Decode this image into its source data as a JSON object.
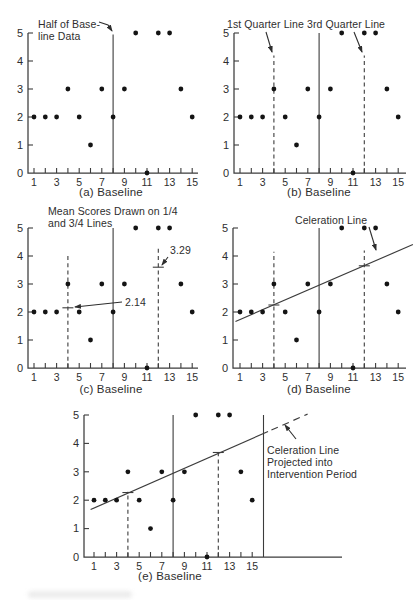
{
  "figure": {
    "ink": "#2e2e2e",
    "axis_color": "#3c3c3c",
    "dot_color": "#141414",
    "background": "#ffffff"
  },
  "chart_data": [
    {
      "id": "a",
      "type": "scatter",
      "caption": "(a) Baseline",
      "xlim": [
        0,
        16
      ],
      "ylim": [
        0,
        5
      ],
      "x_ticks_every": [
        1,
        2,
        3,
        4,
        5,
        6,
        7,
        8,
        9,
        10,
        11,
        12,
        13,
        14,
        15
      ],
      "x_labeled": [
        1,
        3,
        5,
        7,
        9,
        11,
        13,
        15
      ],
      "y_ticks": [
        0,
        1,
        2,
        3,
        4,
        5
      ],
      "points": [
        [
          1,
          2
        ],
        [
          2,
          2
        ],
        [
          3,
          2
        ],
        [
          4,
          3
        ],
        [
          5,
          2
        ],
        [
          6,
          1
        ],
        [
          7,
          3
        ],
        [
          8,
          2
        ],
        [
          9,
          3
        ],
        [
          10,
          5
        ],
        [
          11,
          0
        ],
        [
          12,
          5
        ],
        [
          13,
          5
        ],
        [
          14,
          3
        ],
        [
          15,
          2
        ]
      ],
      "vlines": [
        {
          "x": 8,
          "from": 0,
          "to": 4.95,
          "style": "solid"
        }
      ],
      "mean_marks": [],
      "celeration_segments": [],
      "annotations": [
        {
          "lines": [
            "Half of Base-",
            "line Data"
          ],
          "x": 38,
          "y": 28,
          "lh": 12,
          "arrow": [
            [
              99,
              22
            ],
            [
              108,
              25
            ],
            [
              112,
              31
            ]
          ]
        }
      ]
    },
    {
      "id": "b",
      "type": "scatter",
      "caption": "(b) Baseline",
      "xlim": [
        0,
        16
      ],
      "ylim": [
        0,
        5
      ],
      "x_ticks_every": [
        1,
        2,
        3,
        4,
        5,
        6,
        7,
        8,
        9,
        10,
        11,
        12,
        13,
        14,
        15
      ],
      "x_labeled": [
        1,
        3,
        5,
        7,
        9,
        11,
        13,
        15
      ],
      "y_ticks": [
        0,
        1,
        2,
        3,
        4,
        5
      ],
      "points": [
        [
          1,
          2
        ],
        [
          2,
          2
        ],
        [
          3,
          2
        ],
        [
          4,
          3
        ],
        [
          5,
          2
        ],
        [
          6,
          1
        ],
        [
          7,
          3
        ],
        [
          8,
          2
        ],
        [
          9,
          3
        ],
        [
          10,
          5
        ],
        [
          11,
          0
        ],
        [
          12,
          5
        ],
        [
          13,
          5
        ],
        [
          14,
          3
        ],
        [
          15,
          2
        ]
      ],
      "vlines": [
        {
          "x": 8,
          "from": 0,
          "to": 5,
          "style": "solid"
        },
        {
          "x": 4,
          "from": 0,
          "to": 4.2,
          "style": "dashed"
        },
        {
          "x": 12,
          "from": 0,
          "to": 4.2,
          "style": "dashed"
        }
      ],
      "mean_marks": [],
      "celeration_segments": [],
      "annotations": [
        {
          "lines": [
            "1st Quarter Line"
          ],
          "x": 19,
          "y": 28,
          "lh": 12,
          "arrow": [
            [
              58,
              32
            ],
            [
              64,
              52
            ]
          ]
        },
        {
          "lines": [
            "3rd Quarter Line"
          ],
          "x": 99,
          "y": 28,
          "lh": 12,
          "arrow": [
            [
              146,
              32
            ],
            [
              154,
              52
            ]
          ]
        }
      ]
    },
    {
      "id": "c",
      "type": "scatter",
      "caption": "(c) Baseline",
      "xlim": [
        0,
        16
      ],
      "ylim": [
        0,
        5
      ],
      "x_ticks_every": [
        1,
        2,
        3,
        4,
        5,
        6,
        7,
        8,
        9,
        10,
        11,
        12,
        13,
        14,
        15
      ],
      "x_labeled": [
        1,
        3,
        5,
        7,
        9,
        11,
        13,
        15
      ],
      "y_ticks": [
        0,
        1,
        2,
        3,
        4,
        5
      ],
      "points": [
        [
          1,
          2
        ],
        [
          2,
          2
        ],
        [
          3,
          2
        ],
        [
          4,
          3
        ],
        [
          5,
          2
        ],
        [
          6,
          1
        ],
        [
          7,
          3
        ],
        [
          8,
          2
        ],
        [
          9,
          3
        ],
        [
          10,
          5
        ],
        [
          11,
          0
        ],
        [
          12,
          5
        ],
        [
          13,
          5
        ],
        [
          14,
          3
        ],
        [
          15,
          2
        ]
      ],
      "vlines": [
        {
          "x": 8,
          "from": 0,
          "to": 5,
          "style": "solid"
        },
        {
          "x": 4,
          "from": 0,
          "to": 4.05,
          "style": "dashed"
        },
        {
          "x": 12,
          "from": 0,
          "to": 4.35,
          "style": "dashed"
        }
      ],
      "mean_marks": [
        {
          "x": 4,
          "y_draw": 2.15,
          "value": 2.14
        },
        {
          "x": 12,
          "y_draw": 3.6,
          "value": 3.29
        }
      ],
      "celeration_segments": [],
      "annotations": [
        {
          "lines": [
            "Mean Scores Drawn on 1/4",
            "and 3/4 Lines"
          ],
          "x": 48,
          "y": 19,
          "lh": 12,
          "arrow": null
        },
        {
          "lines": [
            "2.14"
          ],
          "x": 125,
          "y": 110,
          "lh": 12,
          "arrow": [
            [
              122,
              106
            ],
            [
              75,
              111
            ]
          ]
        },
        {
          "lines": [
            "3.29"
          ],
          "x": 170,
          "y": 58,
          "lh": 12,
          "arrow": [
            [
              168,
              61
            ],
            [
              162,
              69
            ]
          ]
        }
      ]
    },
    {
      "id": "d",
      "type": "scatter",
      "caption": "(d) Baseline",
      "xlim": [
        0,
        16
      ],
      "ylim": [
        0,
        5
      ],
      "x_ticks_every": [
        1,
        2,
        3,
        4,
        5,
        6,
        7,
        8,
        9,
        10,
        11,
        12,
        13,
        14,
        15
      ],
      "x_labeled": [
        1,
        3,
        5,
        7,
        9,
        11,
        13,
        15
      ],
      "y_ticks": [
        0,
        1,
        2,
        3,
        4,
        5
      ],
      "points": [
        [
          1,
          2
        ],
        [
          2,
          2
        ],
        [
          3,
          2
        ],
        [
          4,
          3
        ],
        [
          5,
          2
        ],
        [
          6,
          1
        ],
        [
          7,
          3
        ],
        [
          8,
          2
        ],
        [
          9,
          3
        ],
        [
          10,
          5
        ],
        [
          11,
          0
        ],
        [
          12,
          5
        ],
        [
          13,
          5
        ],
        [
          14,
          3
        ],
        [
          15,
          2
        ]
      ],
      "vlines": [
        {
          "x": 8,
          "from": 0,
          "to": 5,
          "style": "solid"
        },
        {
          "x": 4,
          "from": 0,
          "to": 4.15,
          "style": "dashed"
        },
        {
          "x": 12,
          "from": 0,
          "to": 4.2,
          "style": "dashed"
        }
      ],
      "mean_marks": [
        {
          "x": 4,
          "y_draw": 2.25
        },
        {
          "x": 12,
          "y_draw": 3.65
        }
      ],
      "celeration_segments": [
        {
          "x1": 0.6,
          "y1": 1.66,
          "x2": 16.3,
          "y2": 4.41,
          "style": "solid"
        }
      ],
      "annotations": [
        {
          "lines": [
            "Celeration Line"
          ],
          "x": 87,
          "y": 28,
          "lh": 12,
          "arrow": [
            [
              161,
              31
            ],
            [
              168,
              54
            ]
          ]
        }
      ]
    },
    {
      "id": "e",
      "type": "scatter",
      "caption": "(e) Baseline",
      "xlim": [
        0,
        22
      ],
      "ylim": [
        0,
        5
      ],
      "x_ticks_every": [
        1,
        2,
        3,
        4,
        5,
        6,
        7,
        8,
        9,
        10,
        11,
        12,
        13,
        14,
        15
      ],
      "x_labeled": [
        1,
        3,
        5,
        7,
        9,
        11,
        13,
        15
      ],
      "y_ticks": [
        0,
        1,
        2,
        3,
        4,
        5
      ],
      "points": [
        [
          1,
          2
        ],
        [
          2,
          2
        ],
        [
          3,
          2
        ],
        [
          4,
          3
        ],
        [
          5,
          2
        ],
        [
          6,
          1
        ],
        [
          7,
          3
        ],
        [
          8,
          2
        ],
        [
          9,
          3
        ],
        [
          10,
          5
        ],
        [
          11,
          0
        ],
        [
          12,
          5
        ],
        [
          13,
          5
        ],
        [
          14,
          3
        ],
        [
          15,
          2
        ]
      ],
      "vlines": [
        {
          "x": 8,
          "from": 0,
          "to": 5,
          "style": "solid"
        },
        {
          "x": 16,
          "from": 0,
          "to": 5,
          "style": "solid"
        },
        {
          "x": 4,
          "from": 0,
          "to": 2.3,
          "style": "dashed"
        },
        {
          "x": 12,
          "from": 0,
          "to": 3.72,
          "style": "dashed"
        }
      ],
      "mean_marks": [
        {
          "x": 4,
          "y_draw": 2.27
        },
        {
          "x": 12,
          "y_draw": 3.68
        }
      ],
      "celeration_segments": [
        {
          "x1": 0.7,
          "y1": 1.67,
          "x2": 16.4,
          "y2": 4.42,
          "style": "solid"
        },
        {
          "x1": 16.7,
          "y1": 4.47,
          "x2": 19.9,
          "y2": 5.03,
          "style": "dashed"
        }
      ],
      "annotations": [
        {
          "lines": [
            "Celeration Line",
            "Projected into",
            "Intervention Period"
          ],
          "x": 243,
          "y": 50,
          "lh": 12,
          "arrow": [
            [
              272,
              35
            ],
            [
              261,
              21
            ]
          ]
        }
      ]
    }
  ]
}
